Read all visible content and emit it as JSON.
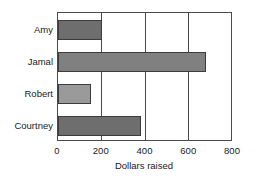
{
  "chart_data": {
    "type": "bar",
    "orientation": "horizontal",
    "title": "",
    "xlabel": "Dollars raised",
    "ylabel": "",
    "categories": [
      "Amy",
      "Jamal",
      "Robert",
      "Courtney"
    ],
    "values": [
      200,
      675,
      150,
      380
    ],
    "xlim": [
      0,
      800
    ],
    "xticks": [
      0,
      200,
      400,
      600,
      800
    ],
    "xtick_labels": [
      "0",
      "200",
      "400",
      "600",
      "800"
    ],
    "grid": "vertical",
    "legend": "none",
    "bar_colors": [
      "#6e6e6e",
      "#808080",
      "#9a9a9a",
      "#6e6e6e"
    ],
    "bar_edge_color": "#3c3c3c",
    "axis_color": "#4a4a4a",
    "background": "#ffffff"
  }
}
